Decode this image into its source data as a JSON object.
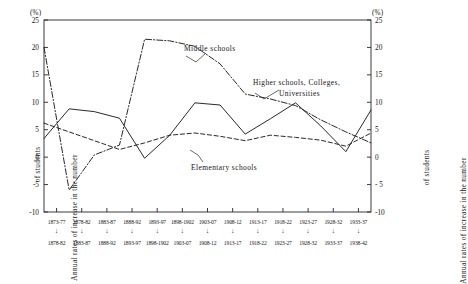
{
  "axis": {
    "unit_left": "(%)",
    "unit_right": "(%)",
    "y_title_left_line1": "Annual rates of increase in the number",
    "y_title_left_line2": "of students",
    "y_title_right_line1": "Annual rates of increase in the number",
    "y_title_right_line2": "of students",
    "y_ticks": [
      "25",
      "20",
      "15",
      "10",
      "5",
      "0",
      "-5",
      "-10"
    ],
    "y_ticks_right": [
      "25",
      "20",
      "15",
      "10",
      "5",
      "0",
      "- 5",
      "-10"
    ]
  },
  "labels": {
    "middle": "Middle schools",
    "higher_line1": "Higher schools, Colleges,",
    "higher_line2": "Universities",
    "elementary": "Elementary schools"
  },
  "chart_data": {
    "type": "line",
    "title": "",
    "xlabel": "",
    "ylabel": "Annual rates of increase in the number of students",
    "ylim": [
      -10,
      25
    ],
    "yticks": [
      -10,
      -5,
      0,
      5,
      10,
      15,
      20,
      25
    ],
    "grid": false,
    "legend_position": "inline-annotations",
    "categories": [
      "1873-77",
      "1878-82",
      "1883-87",
      "1888-92",
      "1893-97",
      "1898-1902",
      "1903-07",
      "1908-12",
      "1913-17",
      "1918-22",
      "1923-27",
      "1928-32",
      "1933-37"
    ],
    "categories_row2": [
      "1878-82",
      "1883-87",
      "1888-92",
      "1893-97",
      "1898-1902",
      "1903-07",
      "1908-12",
      "1913-17",
      "1918-22",
      "1923-27",
      "1928-32",
      "1933-37",
      "1938-42"
    ],
    "series": [
      {
        "name": "Middle schools",
        "style": "dash-dot",
        "values": [
          20.0,
          -6.0,
          0.4,
          2.2,
          21.5,
          21.2,
          20.2,
          17.0,
          11.5,
          10.6,
          9.4,
          6.8,
          4.6
        ]
      },
      {
        "name": "Higher schools, Colleges, Universities",
        "style": "solid",
        "values": [
          3.4,
          8.8,
          8.3,
          7.1,
          -0.2,
          4.0,
          9.9,
          9.5,
          4.2,
          7.0,
          9.9,
          5.7,
          1.0
        ]
      },
      {
        "name": "Elementary schools",
        "style": "dashed",
        "values": [
          6.2,
          4.6,
          3.0,
          1.4,
          2.6,
          4.0,
          4.4,
          3.8,
          3.0,
          4.0,
          3.6,
          3.1,
          2.0
        ]
      }
    ],
    "series_tail": [
      {
        "name": "Middle schools",
        "value": 2.6
      },
      {
        "name": "Higher schools, Colleges, Universities",
        "value": 8.6
      },
      {
        "name": "Elementary schools",
        "value": 4.4
      }
    ]
  }
}
